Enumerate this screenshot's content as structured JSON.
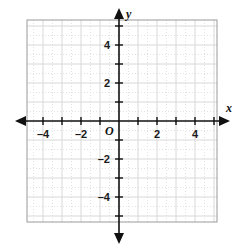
{
  "chart_data": {
    "type": "scatter",
    "title": "",
    "xlabel": "x",
    "ylabel": "y",
    "origin_label": "O",
    "xlim": [
      -4.85,
      5.15
    ],
    "ylim": [
      -5.3,
      5.3
    ],
    "grid": true,
    "grid_major_step": 1,
    "grid_minor_step": 0.5,
    "legend": null,
    "series": [],
    "x_ticks": [
      -4,
      -3,
      -2,
      -1,
      0,
      1,
      2,
      3,
      4,
      5
    ],
    "y_ticks": [
      -5,
      -4,
      -3,
      -2,
      -1,
      0,
      1,
      2,
      3,
      4,
      5
    ],
    "x_tick_labels": [
      {
        "value": -4,
        "text": "–4"
      },
      {
        "value": -2,
        "text": "–2"
      },
      {
        "value": 2,
        "text": "2"
      },
      {
        "value": 4,
        "text": "4"
      }
    ],
    "y_tick_labels": [
      {
        "value": 4,
        "text": "4"
      },
      {
        "value": 2,
        "text": "2"
      },
      {
        "value": -2,
        "text": "–2"
      },
      {
        "value": -4,
        "text": "–4"
      }
    ],
    "axis_arrows": [
      "left",
      "right",
      "up",
      "down"
    ],
    "colors": {
      "axis": "#111111",
      "grid_major": "#d8d8d8",
      "grid_minor": "#e2e2e2",
      "border": "#9a9a9a",
      "background": "#ffffff",
      "text": "#1a1a1a"
    }
  },
  "plot": {
    "geometry": {
      "box_left": 27,
      "box_top": 20,
      "box_right": 217,
      "box_bottom": 222,
      "origin_x": 119,
      "origin_y": 121,
      "unit_px": 19
    },
    "x_axis_name": "x",
    "y_axis_name": "y",
    "origin_text": "O"
  }
}
